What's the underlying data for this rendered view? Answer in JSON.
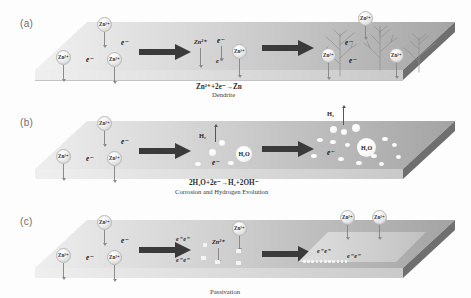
{
  "figure": {
    "background": "#fdfdfd"
  },
  "colors": {
    "slab_top_left": "#efefef",
    "slab_top_right": "#a8a8a8",
    "slab_bevel": "#6d6d6d",
    "slab_front": "#cfcfcf",
    "arrow": "#3a3a3a",
    "ion_text": "#2b2b2b",
    "panel_label": "#6e6e6e",
    "dendrite": "#8c8c8c",
    "bubble": "#fafafa",
    "passivation": "#d6d6d6"
  },
  "panels": [
    {
      "id": "a",
      "label": "(a)",
      "equation": "Zn²⁺+2e⁻→Zn",
      "caption": "Dendrite",
      "stage1": {
        "ions": [
          "Zn²⁺",
          "Zn²⁺",
          "Zn²⁺"
        ],
        "electrons": [
          "e⁻",
          "e⁻"
        ]
      },
      "stage2": {
        "ions": [
          "Zn²⁺",
          "Zn²⁺"
        ],
        "electrons": [
          "e⁻",
          "e⁻"
        ]
      },
      "stage3": {
        "ions": [
          "Zn²⁺",
          "Zn²⁺",
          "Zn²⁺"
        ],
        "electrons": [
          "e⁻",
          "e⁻"
        ],
        "deposit": "dendrite"
      }
    },
    {
      "id": "b",
      "label": "(b)",
      "equation": "2H₂O+2e⁻→H₂+2OH⁻",
      "caption": "Corrosion and Hydrogen Evolution",
      "stage1": {
        "ions": [
          "Zn²⁺",
          "Zn²⁺",
          "Zn²⁺"
        ],
        "electrons": [
          "e⁻",
          "e⁻"
        ]
      },
      "stage2": {
        "gas_label": "H₂",
        "water_label": "H₂O",
        "electrons": [
          "e⁻"
        ]
      },
      "stage3": {
        "gas_label": "H₂",
        "water_label": "H₂O",
        "electrons": [
          "e⁻"
        ]
      }
    },
    {
      "id": "c",
      "label": "(c)",
      "equation": "",
      "caption": "Passivation",
      "stage1": {
        "ions": [
          "Zn²⁺",
          "Zn²⁺",
          "Zn²⁺"
        ],
        "electrons": [
          "e⁻",
          "e⁻"
        ]
      },
      "stage2": {
        "ions": [
          "Zn²⁺",
          "Zn²⁺"
        ],
        "electrons": [
          "e⁻ e⁻",
          "e⁻ e⁻"
        ]
      },
      "stage3": {
        "ions": [
          "Zn²⁺",
          "Zn²⁺"
        ],
        "electrons": [
          "e⁻ e⁻",
          "e⁻ e⁻"
        ],
        "deposit": "passivation layer"
      }
    }
  ]
}
